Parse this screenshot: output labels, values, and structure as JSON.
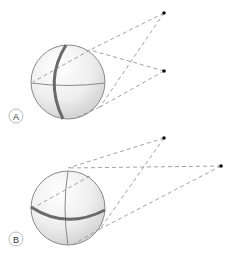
{
  "panels": [
    {
      "label": "A",
      "sphere": {
        "cx": 68,
        "cy": 82,
        "r": 37
      },
      "points": [
        {
          "x": 164,
          "y": 13
        },
        {
          "x": 164,
          "y": 71
        }
      ],
      "highlighted_circle": "vertical meridian"
    },
    {
      "label": "B",
      "sphere": {
        "cx": 68,
        "cy": 208,
        "r": 37
      },
      "points": [
        {
          "x": 164,
          "y": 138
        },
        {
          "x": 221,
          "y": 166
        }
      ],
      "highlighted_circle": "horizontal equator"
    }
  ],
  "colors": {
    "sphere_outline": "#8a8a8a",
    "highlight_line": "#6a6a6a",
    "dashed_line": "#8a8a8a",
    "point": "#111111"
  }
}
